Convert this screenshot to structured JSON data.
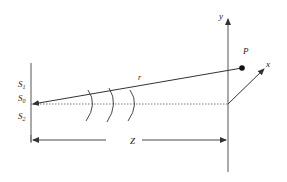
{
  "diagram": {
    "type": "double-slit geometry",
    "colors": {
      "stroke": "#333333",
      "background": "#ffffff"
    },
    "slit_labels": {
      "s1": "S",
      "s1_sub": "1",
      "s0": "S",
      "s0_sub": "0",
      "s2": "S",
      "s2_sub": "2"
    },
    "labels": {
      "r": "r",
      "point": "P",
      "y_axis": "y",
      "x_axis": "x",
      "distance": "Z"
    },
    "wavefronts": 3
  }
}
